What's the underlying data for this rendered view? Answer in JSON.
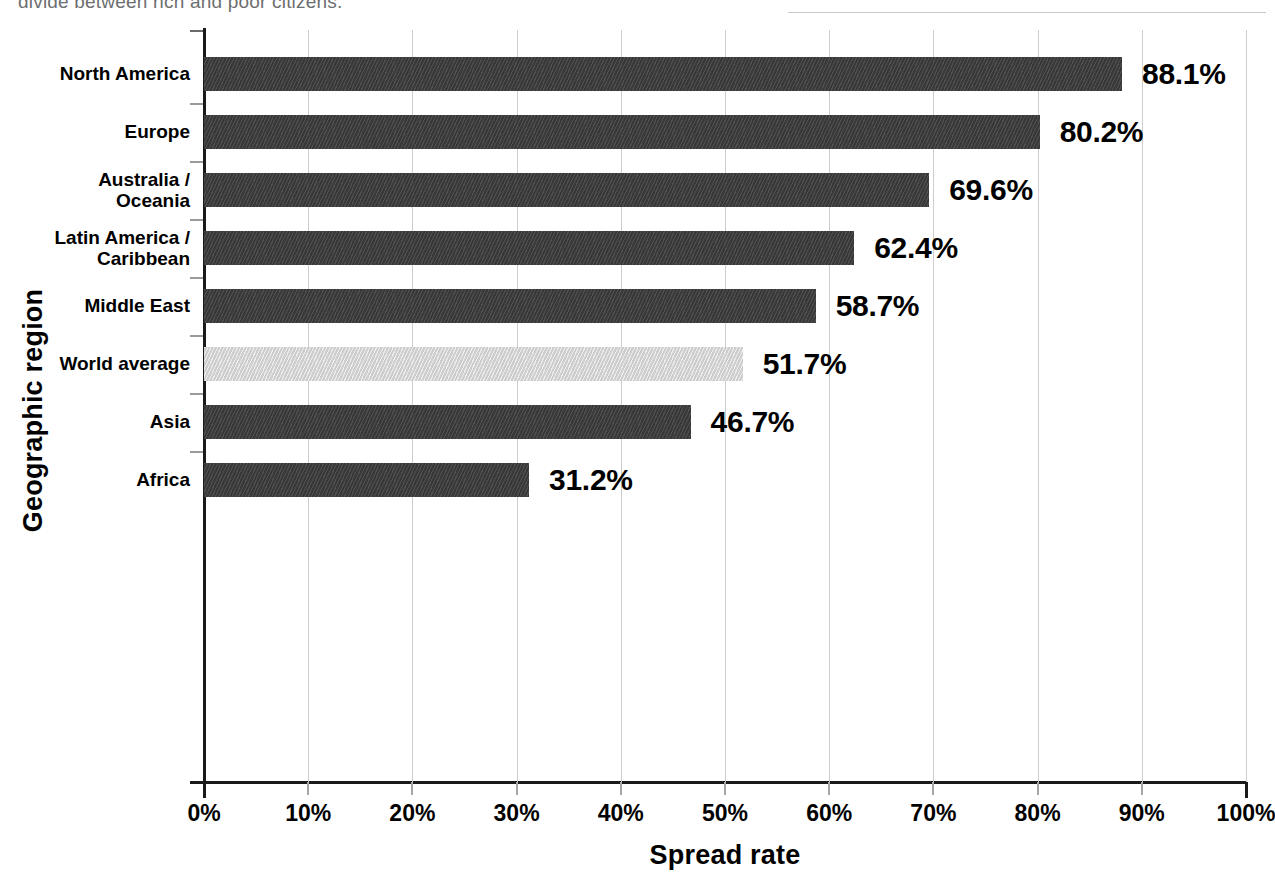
{
  "page": {
    "body_text_fragment": "divide between rich and poor citizens."
  },
  "chart_data": {
    "type": "bar",
    "orientation": "horizontal",
    "title": "",
    "xlabel": "Spread rate",
    "ylabel": "Geographic region",
    "categories": [
      "North America",
      "Europe",
      "Australia /\nOceania",
      "Latin America /\nCaribbean",
      "Middle East",
      "World average",
      "Asia",
      "Africa"
    ],
    "values": [
      88.1,
      80.2,
      69.6,
      62.4,
      58.7,
      51.7,
      46.7,
      31.2
    ],
    "value_labels": [
      "88.1%",
      "80.2%",
      "69.6%",
      "62.4%",
      "58.7%",
      "51.7%",
      "46.7%",
      "31.2%"
    ],
    "highlight_index": 5,
    "xlim": [
      0,
      100
    ],
    "xticks": [
      0,
      10,
      20,
      30,
      40,
      50,
      60,
      70,
      80,
      90,
      100
    ],
    "xtick_labels": [
      "0%",
      "10%",
      "20%",
      "30%",
      "40%",
      "50%",
      "60%",
      "70%",
      "80%",
      "90%",
      "100%"
    ],
    "grid": true,
    "legend": "none",
    "colors": {
      "bar": "#3c3c3c",
      "bar_highlight": "#d8d8d8",
      "gridline": "#cdcdcd",
      "axis": "#1a1a1a",
      "text": "#000000"
    }
  }
}
